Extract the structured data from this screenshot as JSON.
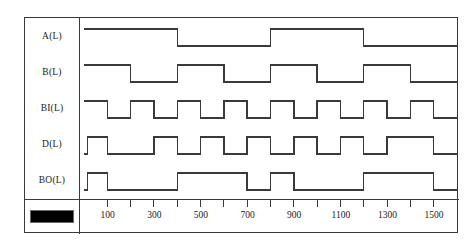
{
  "chart_data": {
    "type": "line",
    "title": "",
    "xlabel": "",
    "ylabel": "",
    "xlim": [
      0,
      1600
    ],
    "grid": false,
    "legend": "none",
    "signal_levels": {
      "low": 0,
      "high": 1
    },
    "x_ticks_major": [
      100,
      300,
      500,
      700,
      900,
      1100,
      1300,
      1500
    ],
    "x_tick_labels": [
      "100",
      "300",
      "500",
      "700",
      "900",
      "1100",
      "1300",
      "1500"
    ],
    "x_ticks_minor": [
      0,
      200,
      400,
      600,
      800,
      1000,
      1200,
      1400,
      1600
    ],
    "series": [
      {
        "name": "A(L)",
        "transitions": [
          {
            "t": 0,
            "v": 1
          },
          {
            "t": 400,
            "v": 0
          },
          {
            "t": 800,
            "v": 1
          },
          {
            "t": 1200,
            "v": 0
          },
          {
            "t": 1600,
            "v": 0
          }
        ]
      },
      {
        "name": "B(L)",
        "transitions": [
          {
            "t": 0,
            "v": 1
          },
          {
            "t": 200,
            "v": 0
          },
          {
            "t": 400,
            "v": 1
          },
          {
            "t": 600,
            "v": 0
          },
          {
            "t": 800,
            "v": 1
          },
          {
            "t": 1000,
            "v": 0
          },
          {
            "t": 1200,
            "v": 1
          },
          {
            "t": 1400,
            "v": 0
          },
          {
            "t": 1600,
            "v": 0
          }
        ]
      },
      {
        "name": "BI(L)",
        "transitions": [
          {
            "t": 0,
            "v": 1
          },
          {
            "t": 100,
            "v": 0
          },
          {
            "t": 200,
            "v": 1
          },
          {
            "t": 300,
            "v": 0
          },
          {
            "t": 400,
            "v": 1
          },
          {
            "t": 500,
            "v": 0
          },
          {
            "t": 600,
            "v": 1
          },
          {
            "t": 700,
            "v": 0
          },
          {
            "t": 800,
            "v": 1
          },
          {
            "t": 900,
            "v": 0
          },
          {
            "t": 1000,
            "v": 1
          },
          {
            "t": 1100,
            "v": 0
          },
          {
            "t": 1200,
            "v": 1
          },
          {
            "t": 1300,
            "v": 0
          },
          {
            "t": 1400,
            "v": 1
          },
          {
            "t": 1500,
            "v": 0
          },
          {
            "t": 1600,
            "v": 0
          }
        ]
      },
      {
        "name": "D(L)",
        "transitions": [
          {
            "t": 0,
            "v": 0
          },
          {
            "t": 15,
            "v": 1
          },
          {
            "t": 100,
            "v": 0
          },
          {
            "t": 300,
            "v": 1
          },
          {
            "t": 400,
            "v": 0
          },
          {
            "t": 500,
            "v": 1
          },
          {
            "t": 600,
            "v": 0
          },
          {
            "t": 700,
            "v": 1
          },
          {
            "t": 800,
            "v": 0
          },
          {
            "t": 900,
            "v": 1
          },
          {
            "t": 1000,
            "v": 0
          },
          {
            "t": 1100,
            "v": 1
          },
          {
            "t": 1200,
            "v": 0
          },
          {
            "t": 1300,
            "v": 1
          },
          {
            "t": 1500,
            "v": 0
          },
          {
            "t": 1600,
            "v": 0
          }
        ]
      },
      {
        "name": "BO(L)",
        "transitions": [
          {
            "t": 0,
            "v": 0
          },
          {
            "t": 15,
            "v": 1
          },
          {
            "t": 100,
            "v": 0
          },
          {
            "t": 400,
            "v": 1
          },
          {
            "t": 700,
            "v": 0
          },
          {
            "t": 800,
            "v": 1
          },
          {
            "t": 900,
            "v": 0
          },
          {
            "t": 1200,
            "v": 1
          },
          {
            "t": 1500,
            "v": 0
          },
          {
            "t": 1600,
            "v": 0
          }
        ]
      }
    ]
  },
  "signal_labels": [
    {
      "label": "A(L)"
    },
    {
      "label": "B(L)"
    },
    {
      "label": "BI(L)"
    },
    {
      "label": "D(L)"
    },
    {
      "label": "BO(L)"
    }
  ],
  "legend": {
    "swatch_color": "#000000",
    "swatch_name": "black-bar"
  },
  "style": {
    "trace_color": "#3a3a3a",
    "frame_color": "#3a3a3a",
    "background": "#ffffff"
  }
}
